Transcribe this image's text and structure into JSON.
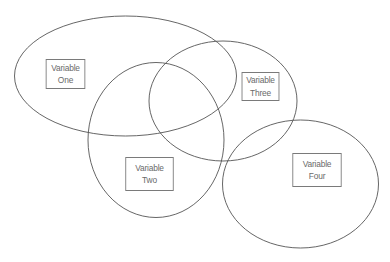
{
  "diagram": {
    "type": "venn",
    "title": "",
    "stroke_color": "#555555",
    "box_border_color": "#7a7a7a",
    "text_color": "#6a6a6a",
    "sets": [
      {
        "id": "one",
        "label_line1": "Variable",
        "label_line2": "One"
      },
      {
        "id": "two",
        "label_line1": "Variable",
        "label_line2": "Two"
      },
      {
        "id": "three",
        "label_line1": "Variable",
        "label_line2": "Three"
      },
      {
        "id": "four",
        "label_line1": "Variable",
        "label_line2": "Four"
      }
    ],
    "overlaps": [
      [
        "one",
        "two"
      ],
      [
        "one",
        "three"
      ],
      [
        "two",
        "three"
      ],
      [
        "one",
        "two",
        "three"
      ],
      [
        "two",
        "four"
      ],
      [
        "three",
        "four"
      ]
    ]
  }
}
